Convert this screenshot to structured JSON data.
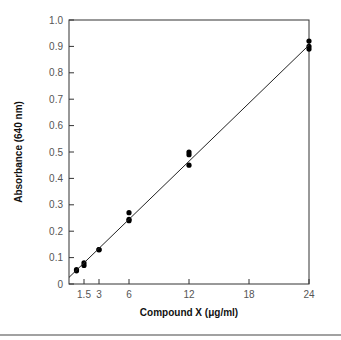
{
  "chart_data": {
    "type": "scatter",
    "title": "",
    "xlabel": "Compound X (μg/ml)",
    "ylabel": "Absorbance (640 nm)",
    "xlim": [
      0,
      24
    ],
    "ylim": [
      0,
      1.0
    ],
    "x_ticks": [
      1.5,
      3,
      6,
      12,
      18,
      24
    ],
    "x_tick_labels": [
      "1.5",
      "3",
      "6",
      "12",
      "18",
      "24"
    ],
    "y_ticks": [
      0,
      0.1,
      0.2,
      0.3,
      0.4,
      0.5,
      0.6,
      0.7,
      0.8,
      0.9,
      1.0
    ],
    "y_tick_labels": [
      "0",
      "0.1",
      "0.2",
      "0.3",
      "0.4",
      "0.5",
      "0.6",
      "0.7",
      "0.8",
      "0.9",
      "1.0"
    ],
    "grid": false,
    "legend": null,
    "series": [
      {
        "name": "measurements",
        "points": [
          {
            "x": 0.75,
            "y": 0.05
          },
          {
            "x": 0.75,
            "y": 0.055
          },
          {
            "x": 1.5,
            "y": 0.07
          },
          {
            "x": 1.5,
            "y": 0.08
          },
          {
            "x": 3,
            "y": 0.13
          },
          {
            "x": 3,
            "y": 0.13
          },
          {
            "x": 6,
            "y": 0.24
          },
          {
            "x": 6,
            "y": 0.245
          },
          {
            "x": 6,
            "y": 0.27
          },
          {
            "x": 12,
            "y": 0.45
          },
          {
            "x": 12,
            "y": 0.49
          },
          {
            "x": 12,
            "y": 0.5
          },
          {
            "x": 24,
            "y": 0.89
          },
          {
            "x": 24,
            "y": 0.9
          },
          {
            "x": 24,
            "y": 0.92
          }
        ]
      },
      {
        "name": "regression line",
        "type": "line",
        "points": [
          {
            "x": 0,
            "y": 0.025
          },
          {
            "x": 24,
            "y": 0.905
          }
        ]
      }
    ]
  }
}
